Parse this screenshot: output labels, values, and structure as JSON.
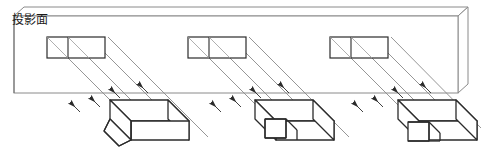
{
  "diagram": {
    "title_text": "投影面",
    "title_meaning": "projection plane",
    "type": "parallel-projection-illustration",
    "colors": {
      "outline": "#2b2b2b",
      "plane_edge": "#7a7a7a",
      "ray": "#8a8a8a",
      "background": "#ffffff"
    },
    "projection_plane": {
      "label": "投影面",
      "front_face": {
        "x": 14,
        "y": 16,
        "width": 444,
        "height": 77
      },
      "depth_offset": {
        "dx": 10,
        "dy": -9
      },
      "description": "slab drawn with thickness; top and right show receding edges"
    },
    "ray_direction": {
      "angle_deg": 45,
      "dx": -1,
      "dy": -1,
      "arrowhead": "up-left",
      "label": "parallel projection rays"
    },
    "projections": [
      {
        "name": "projection-1",
        "x": 47,
        "y": 37,
        "width": 58,
        "height": 21,
        "divider_x": 68,
        "diagonals": 2
      },
      {
        "name": "projection-2",
        "x": 188,
        "y": 37,
        "width": 58,
        "height": 21,
        "divider_x": 209,
        "diagonals": 2
      },
      {
        "name": "projection-3",
        "x": 330,
        "y": 37,
        "width": 58,
        "height": 21,
        "divider_x": 351,
        "diagonals": 2
      }
    ],
    "solids": [
      {
        "name": "solid-1",
        "shape_label": "block with chamfered front-left cut",
        "origin": {
          "x": 103,
          "y": 100
        }
      },
      {
        "name": "solid-2",
        "shape_label": "block with rectangular step notch",
        "origin": {
          "x": 255,
          "y": 100
        }
      },
      {
        "name": "solid-3",
        "shape_label": "block with square corner groove",
        "origin": {
          "x": 398,
          "y": 100
        }
      }
    ],
    "ray_groups": [
      {
        "name": "ray-group-1",
        "count": 4
      },
      {
        "name": "ray-group-2",
        "count": 4
      },
      {
        "name": "ray-group-3",
        "count": 4
      }
    ]
  }
}
